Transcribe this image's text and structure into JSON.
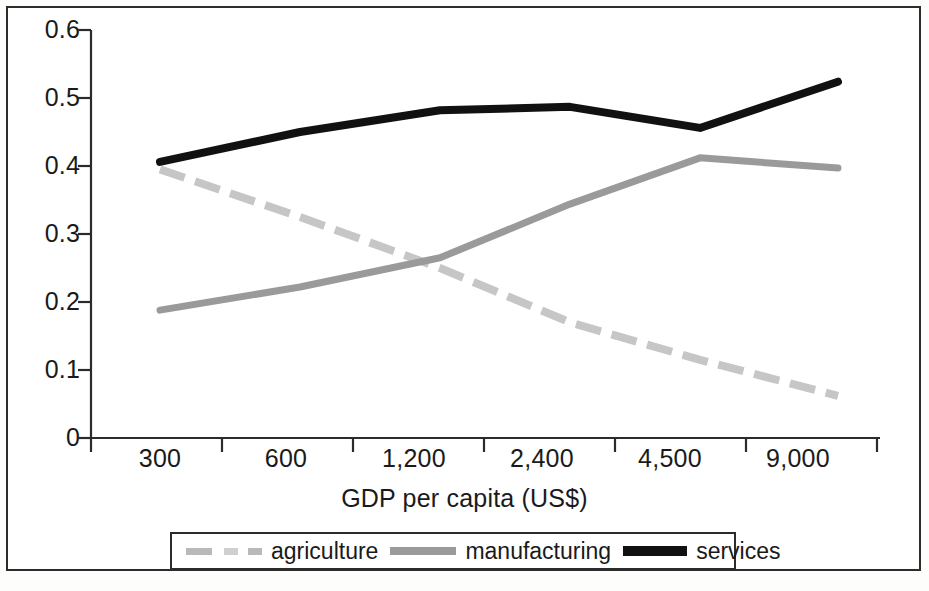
{
  "chart_data": {
    "type": "line",
    "title": "",
    "subtitle": "",
    "xlabel": "GDP per capita (US$)",
    "ylabel": "",
    "categories": [
      "300",
      "600",
      "1,200",
      "2,400",
      "4,500",
      "9,000"
    ],
    "ylim": [
      0,
      0.6
    ],
    "y_ticks": [
      "0",
      "0.1",
      "0.2",
      "0.3",
      "0.4",
      "0.5",
      "0.6"
    ],
    "y_tick_values": [
      0,
      0.1,
      0.2,
      0.3,
      0.4,
      0.5,
      0.6
    ],
    "grid": false,
    "legend_position": "bottom",
    "series": [
      {
        "name": "agriculture",
        "style": "dashed",
        "color": "#c6c6c6",
        "values": [
          0.395,
          0.325,
          0.25,
          0.17,
          0.115,
          0.062
        ]
      },
      {
        "name": "manufacturing",
        "style": "solid",
        "color": "#9a9a9a",
        "values": [
          0.188,
          0.222,
          0.265,
          0.344,
          0.412,
          0.397
        ]
      },
      {
        "name": "services",
        "style": "solid-bold",
        "color": "#111111",
        "values": [
          0.406,
          0.45,
          0.482,
          0.487,
          0.456,
          0.524
        ]
      }
    ]
  },
  "axes": {
    "x_axis_title": "GDP per capita (US$)",
    "x_tick_labels": [
      "300",
      "600",
      "1,200",
      "2,400",
      "4,500",
      "9,000"
    ],
    "y_tick_labels": [
      "0.6",
      "0.5",
      "0.4",
      "0.3",
      "0.2",
      "0.1",
      "0"
    ]
  },
  "legend": {
    "items": [
      {
        "label": "agriculture",
        "swatch": "dashed-light-gray-line-swatch"
      },
      {
        "label": "manufacturing",
        "swatch": "solid-gray-line-swatch"
      },
      {
        "label": "services",
        "swatch": "solid-black-line-swatch"
      }
    ]
  }
}
